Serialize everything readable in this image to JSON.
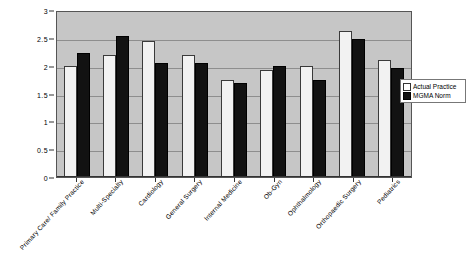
{
  "chart_data": {
    "type": "bar",
    "title": "",
    "xlabel": "",
    "ylabel": "",
    "ylim": [
      0,
      3
    ],
    "ytick_labels": [
      "3",
      "2.5",
      "2",
      "1.5",
      "1",
      "0.5",
      "0"
    ],
    "ytick_values": [
      3,
      2.5,
      2,
      1.5,
      1,
      0.5,
      0
    ],
    "grid": true,
    "legend_position": "right",
    "categories": [
      "Primary Care/ Family Practice",
      "Multi-Specialty",
      "Cardiology",
      "General Surgery",
      "Internal Medicine",
      "Ob-Gyn",
      "Ophthalmology",
      "Orthopaedic Surgery",
      "Pediatrics"
    ],
    "series": [
      {
        "name": "Actual Practice",
        "color": "#f2f2f2",
        "values": [
          2.0,
          2.2,
          2.45,
          2.2,
          1.75,
          1.93,
          2.0,
          2.62,
          2.1
        ]
      },
      {
        "name": "MGMA Norm",
        "color": "#121212",
        "values": [
          2.22,
          2.53,
          2.05,
          2.05,
          1.68,
          2.0,
          1.75,
          2.48,
          1.95
        ]
      }
    ]
  },
  "legend": {
    "items": [
      {
        "label": "Actual Practice",
        "swatch": "white-square"
      },
      {
        "label": "MGMA Norm",
        "swatch": "black-square"
      }
    ]
  }
}
